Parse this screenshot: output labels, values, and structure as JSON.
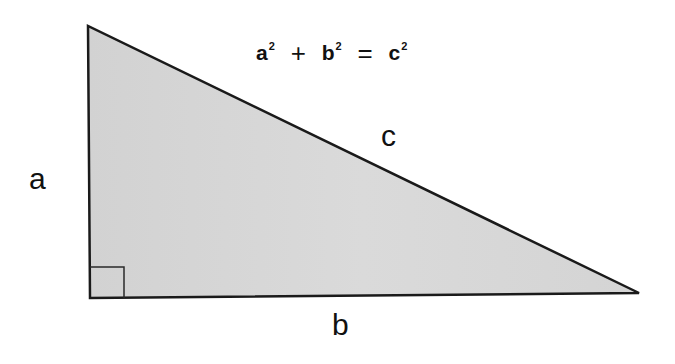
{
  "diagram": {
    "formula": {
      "term1_base": "a",
      "term1_exp": "2",
      "plus": "+",
      "term2_base": "b",
      "term2_exp": "2",
      "equals": "=",
      "term3_base": "c",
      "term3_exp": "2"
    },
    "labels": {
      "side_a": "a",
      "side_b": "b",
      "side_c": "c"
    },
    "colors": {
      "fill": "#d6d6d6",
      "stroke": "#1a1a1a",
      "text": "#111111"
    }
  }
}
